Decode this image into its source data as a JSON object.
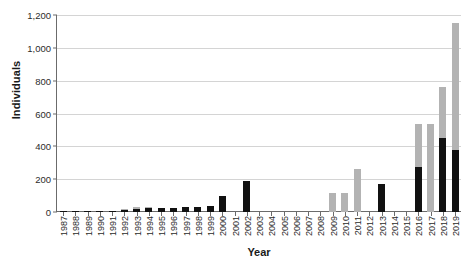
{
  "chart_data": {
    "type": "bar",
    "stacked": true,
    "title": "",
    "xlabel": "Year",
    "ylabel": "Individuals",
    "ylim": [
      0,
      1200
    ],
    "yticks": [
      0,
      200,
      400,
      600,
      800,
      1000,
      1200
    ],
    "ytick_labels": [
      "0",
      "200",
      "400",
      "600",
      "800",
      "1,000",
      "1,200"
    ],
    "grid": "horizontal",
    "legend": "none",
    "colors": {
      "series_black": "#111111",
      "series_gray": "#b3b3b3",
      "grid": "#d4d4d4",
      "axis": "#6b6b6b"
    },
    "categories": [
      "1987",
      "1988",
      "1989",
      "1990",
      "1991",
      "1992",
      "1993",
      "1994",
      "1995",
      "1996",
      "1997",
      "1998",
      "1999",
      "2000",
      "2001",
      "2002",
      "2003",
      "2004",
      "2005",
      "2006",
      "2007",
      "2008",
      "2009",
      "2010",
      "2011",
      "2012",
      "2013",
      "2014",
      "2015",
      "2016",
      "2017",
      "2018",
      "2019"
    ],
    "series": [
      {
        "name": "black",
        "values": [
          2,
          3,
          4,
          5,
          8,
          14,
          20,
          22,
          24,
          24,
          30,
          33,
          38,
          95,
          0,
          190,
          0,
          0,
          0,
          0,
          0,
          0,
          0,
          0,
          0,
          0,
          170,
          0,
          0,
          275,
          0,
          450,
          375
        ]
      },
      {
        "name": "gray",
        "values": [
          0,
          0,
          0,
          0,
          0,
          2,
          10,
          8,
          0,
          0,
          0,
          0,
          0,
          0,
          0,
          0,
          0,
          0,
          0,
          0,
          0,
          0,
          115,
          115,
          265,
          0,
          0,
          0,
          0,
          260,
          535,
          310,
          775
        ]
      }
    ],
    "totals": [
      2,
      3,
      4,
      5,
      8,
      16,
      30,
      30,
      24,
      24,
      30,
      33,
      38,
      95,
      0,
      190,
      0,
      0,
      0,
      0,
      0,
      0,
      115,
      115,
      265,
      0,
      170,
      0,
      0,
      535,
      535,
      760,
      1150
    ]
  }
}
